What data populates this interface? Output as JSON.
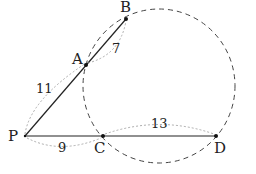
{
  "diagram": {
    "type": "secant-secant geometry",
    "points": {
      "P": {
        "label": "P",
        "x": 25,
        "y": 136
      },
      "A": {
        "label": "A",
        "x": 86,
        "y": 65
      },
      "B": {
        "label": "B",
        "x": 126,
        "y": 19
      },
      "C": {
        "label": "C",
        "x": 103,
        "y": 136
      },
      "D": {
        "label": "D",
        "x": 216,
        "y": 136
      }
    },
    "circle": {
      "cx": 159,
      "cy": 86,
      "rx": 76,
      "ry": 77,
      "style": "dashed"
    },
    "segment_lengths": {
      "PA": "11",
      "AB": "7",
      "PC": "9",
      "CD": "13"
    },
    "colors": {
      "line": "#222222",
      "dashed": "#444444",
      "dotted": "#888888"
    }
  }
}
